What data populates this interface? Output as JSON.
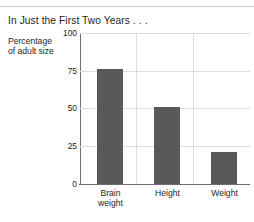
{
  "header": {
    "title": "In Just the First Two Years . . ."
  },
  "chart_data": {
    "type": "bar",
    "title": "In Just the First Two Years . . .",
    "xlabel": "",
    "ylabel": "Percentage of adult size",
    "ylabel_lines": [
      "Percentage",
      "of adult size"
    ],
    "categories": [
      "Brain weight",
      "Height",
      "Weight"
    ],
    "category_lines": [
      [
        "Brain",
        "weight"
      ],
      [
        "Height"
      ],
      [
        "Weight"
      ]
    ],
    "values": [
      76,
      51,
      21
    ],
    "ylim": [
      0,
      100
    ],
    "yticks": [
      0,
      25,
      50,
      75,
      100
    ],
    "ytick_labels": [
      "0",
      "25",
      "50",
      "75",
      "100"
    ],
    "grid": "horizontal-and-vertical",
    "legend": "none",
    "bar_color": "#595959",
    "grid_color": "#dcdddf",
    "axis_color": "#6d6e71",
    "background": "#ffffff"
  }
}
